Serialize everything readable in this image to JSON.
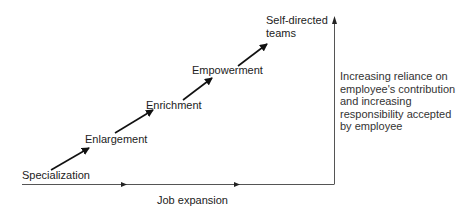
{
  "diagram": {
    "stages": [
      {
        "label": "Specialization"
      },
      {
        "label": "Enlargement"
      },
      {
        "label": "Enrichment"
      },
      {
        "label": "Empowerment"
      },
      {
        "label": "Self-directed",
        "label_line2": "teams"
      }
    ],
    "x_axis_label": "Job expansion",
    "y_axis_note": {
      "lines": [
        "Increasing reliance on",
        "employee's contribution",
        "and increasing",
        "responsibility accepted",
        "by employee"
      ]
    },
    "colors": {
      "arrow": "#111111",
      "axis": "#555555",
      "text": "#222222"
    }
  }
}
